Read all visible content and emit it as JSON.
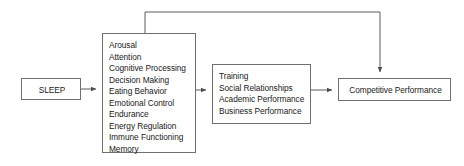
{
  "diagram": {
    "type": "flow-diagram",
    "title_visible": false,
    "canvas": {
      "width": 464,
      "height": 166,
      "background": "#ffffff"
    },
    "style": {
      "box_border_color": "#6f6f6f",
      "box_fill_color": "#ffffff",
      "edge_color": "#5a5a5a",
      "text_color": "#1a1a1a"
    },
    "nodes": [
      {
        "id": "sleep",
        "kind": "single-label",
        "label": "SLEEP"
      },
      {
        "id": "mediators",
        "kind": "list",
        "items": [
          "Arousal",
          "Attention",
          "Cognitive Processing",
          "Decision Making",
          "Eating Behavior",
          "Emotional Control",
          "Endurance",
          "Energy Regulation",
          "Immune Functioning",
          "Memory"
        ]
      },
      {
        "id": "domains",
        "kind": "list",
        "items": [
          "Training",
          "Social Relationships",
          "Academic Performance",
          "Business Performance"
        ]
      },
      {
        "id": "outcome",
        "kind": "single-label",
        "label": "Competitive Performance"
      }
    ],
    "edges": [
      {
        "id": "sleep-to-mediators",
        "from": "sleep",
        "to": "mediators",
        "direction": "right",
        "style": "straight"
      },
      {
        "id": "mediators-to-domains",
        "from": "mediators",
        "to": "domains",
        "direction": "right",
        "style": "straight"
      },
      {
        "id": "domains-to-outcome",
        "from": "domains",
        "to": "outcome",
        "direction": "right",
        "style": "straight"
      },
      {
        "id": "mediators-to-outcome-bypass",
        "from": "mediators",
        "to": "outcome",
        "direction": "down",
        "style": "orthogonal-over-top"
      }
    ]
  }
}
